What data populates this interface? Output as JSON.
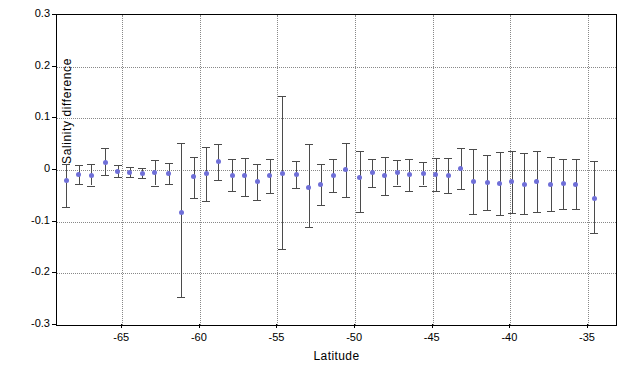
{
  "chart_data": {
    "type": "scatter",
    "title": "",
    "xlabel": "Latitude",
    "ylabel": "Salinity  difference",
    "xlim": [
      -69.2,
      -33.2
    ],
    "ylim": [
      -0.3,
      0.3
    ],
    "grid": true,
    "legend": null,
    "yticks": [
      0.3,
      0.2,
      0.1,
      0.0,
      -0.1,
      -0.2,
      -0.3
    ],
    "ytick_labels": [
      "0.3",
      "0.2",
      "0.1",
      "0",
      "-0.1",
      "-0.2",
      "-0.3"
    ],
    "xticks": [
      -65,
      -60,
      -55,
      -50,
      -45,
      -40,
      -35
    ],
    "xtick_labels": [
      "-65",
      "-60",
      "-55",
      "-50",
      "-45",
      "-40",
      "-35"
    ],
    "marker_color": "#6f6fd8",
    "errorbar_color": "#4b4b4b",
    "points": [
      {
        "x": -68.6,
        "y": -0.021,
        "yerr_low": -0.072,
        "yerr_high": 0.012
      },
      {
        "x": -67.8,
        "y": -0.008,
        "yerr_low": -0.028,
        "yerr_high": 0.01
      },
      {
        "x": -67.0,
        "y": -0.01,
        "yerr_low": -0.03,
        "yerr_high": 0.011
      },
      {
        "x": -66.1,
        "y": 0.014,
        "yerr_low": -0.01,
        "yerr_high": 0.042
      },
      {
        "x": -65.3,
        "y": -0.003,
        "yerr_low": -0.014,
        "yerr_high": 0.009
      },
      {
        "x": -64.5,
        "y": -0.004,
        "yerr_low": -0.013,
        "yerr_high": 0.006
      },
      {
        "x": -63.7,
        "y": -0.006,
        "yerr_low": -0.015,
        "yerr_high": 0.004
      },
      {
        "x": -62.9,
        "y": -0.005,
        "yerr_low": -0.03,
        "yerr_high": 0.019
      },
      {
        "x": -62.0,
        "y": -0.006,
        "yerr_low": -0.027,
        "yerr_high": 0.013
      },
      {
        "x": -61.2,
        "y": -0.083,
        "yerr_low": -0.245,
        "yerr_high": 0.052
      },
      {
        "x": -60.4,
        "y": -0.013,
        "yerr_low": -0.054,
        "yerr_high": 0.026
      },
      {
        "x": -59.6,
        "y": -0.007,
        "yerr_low": -0.06,
        "yerr_high": 0.044
      },
      {
        "x": -58.8,
        "y": 0.017,
        "yerr_low": -0.02,
        "yerr_high": 0.05
      },
      {
        "x": -57.9,
        "y": -0.01,
        "yerr_low": -0.041,
        "yerr_high": 0.021
      },
      {
        "x": -57.1,
        "y": -0.011,
        "yerr_low": -0.05,
        "yerr_high": 0.024
      },
      {
        "x": -56.3,
        "y": -0.023,
        "yerr_low": -0.058,
        "yerr_high": 0.012
      },
      {
        "x": -55.5,
        "y": -0.011,
        "yerr_low": -0.044,
        "yerr_high": 0.022
      },
      {
        "x": -54.7,
        "y": -0.006,
        "yerr_low": -0.153,
        "yerr_high": 0.143
      },
      {
        "x": -53.8,
        "y": -0.008,
        "yerr_low": -0.035,
        "yerr_high": 0.018
      },
      {
        "x": -53.0,
        "y": -0.033,
        "yerr_low": -0.11,
        "yerr_high": 0.05
      },
      {
        "x": -52.2,
        "y": -0.029,
        "yerr_low": -0.068,
        "yerr_high": 0.012
      },
      {
        "x": -51.4,
        "y": -0.011,
        "yerr_low": -0.042,
        "yerr_high": 0.022
      },
      {
        "x": -50.6,
        "y": 0.001,
        "yerr_low": -0.053,
        "yerr_high": 0.052
      },
      {
        "x": -49.7,
        "y": -0.014,
        "yerr_low": -0.081,
        "yerr_high": 0.036
      },
      {
        "x": -48.9,
        "y": -0.005,
        "yerr_low": -0.032,
        "yerr_high": 0.021
      },
      {
        "x": -48.1,
        "y": -0.011,
        "yerr_low": -0.048,
        "yerr_high": 0.025
      },
      {
        "x": -47.3,
        "y": -0.005,
        "yerr_low": -0.03,
        "yerr_high": 0.02
      },
      {
        "x": -46.5,
        "y": -0.009,
        "yerr_low": -0.04,
        "yerr_high": 0.021
      },
      {
        "x": -45.6,
        "y": -0.007,
        "yerr_low": -0.03,
        "yerr_high": 0.016
      },
      {
        "x": -44.8,
        "y": -0.008,
        "yerr_low": -0.04,
        "yerr_high": 0.024
      },
      {
        "x": -44.0,
        "y": -0.01,
        "yerr_low": -0.044,
        "yerr_high": 0.023
      },
      {
        "x": -43.2,
        "y": 0.002,
        "yerr_low": -0.036,
        "yerr_high": 0.043
      },
      {
        "x": -42.4,
        "y": -0.022,
        "yerr_low": -0.085,
        "yerr_high": 0.04
      },
      {
        "x": -41.5,
        "y": -0.024,
        "yerr_low": -0.078,
        "yerr_high": 0.03
      },
      {
        "x": -40.7,
        "y": -0.026,
        "yerr_low": -0.088,
        "yerr_high": 0.035
      },
      {
        "x": -39.9,
        "y": -0.023,
        "yerr_low": -0.083,
        "yerr_high": 0.037
      },
      {
        "x": -39.1,
        "y": -0.028,
        "yerr_low": -0.086,
        "yerr_high": 0.032
      },
      {
        "x": -38.3,
        "y": -0.023,
        "yerr_low": -0.082,
        "yerr_high": 0.036
      },
      {
        "x": -37.4,
        "y": -0.028,
        "yerr_low": -0.08,
        "yerr_high": 0.025
      },
      {
        "x": -36.6,
        "y": -0.027,
        "yerr_low": -0.076,
        "yerr_high": 0.022
      },
      {
        "x": -35.8,
        "y": -0.028,
        "yerr_low": -0.076,
        "yerr_high": 0.022
      },
      {
        "x": -34.6,
        "y": -0.055,
        "yerr_low": -0.122,
        "yerr_high": 0.018
      }
    ]
  }
}
